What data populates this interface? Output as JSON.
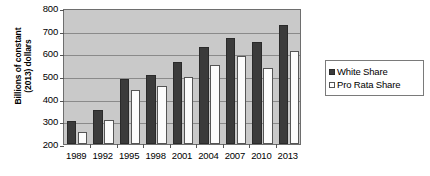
{
  "chart_data": {
    "type": "bar",
    "title": "",
    "xlabel": "",
    "ylabel": "Billions of constant (2013) dollars",
    "ylabel_lines": [
      "Billions of constant",
      "(2013) dollars"
    ],
    "categories": [
      "1989",
      "1992",
      "1995",
      "1998",
      "2001",
      "2004",
      "2007",
      "2010",
      "2013"
    ],
    "series": [
      {
        "name": "White Share",
        "color": "#3b3b3b",
        "swatch": "filled",
        "values": [
          300,
          352,
          488,
          503,
          562,
          630,
          667,
          648,
          727
        ]
      },
      {
        "name": "Pro Rata Share",
        "color": "#fcfcfc",
        "swatch": "hollow",
        "values": [
          255,
          305,
          437,
          455,
          497,
          550,
          588,
          535,
          612
        ]
      }
    ],
    "ylim": [
      200,
      800
    ],
    "yticks": [
      200,
      300,
      400,
      500,
      600,
      700,
      800
    ],
    "ytick_labels": [
      "200",
      "300",
      "400",
      "500",
      "600",
      "700",
      "800"
    ],
    "grid": true,
    "legend_position": "right",
    "plot_background": "#c9c9c9",
    "axis_color": "#6e6e6e"
  }
}
